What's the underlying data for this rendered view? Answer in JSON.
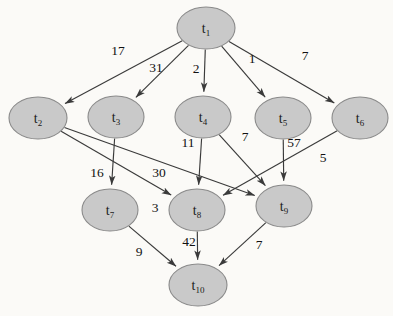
{
  "diagram": {
    "background_color": "#fbfaf7",
    "node_fill": "#c9c9c9",
    "node_stroke": "#8a8a8a",
    "edge_color": "#3a3a3a",
    "nodes": [
      {
        "id": "t1",
        "base": "t",
        "sub": "1",
        "cx": 206,
        "cy": 28,
        "rx": 29,
        "ry": 21
      },
      {
        "id": "t2",
        "base": "t",
        "sub": "2",
        "cx": 38,
        "cy": 118,
        "rx": 29,
        "ry": 21
      },
      {
        "id": "t3",
        "base": "t",
        "sub": "3",
        "cx": 116,
        "cy": 117,
        "rx": 28,
        "ry": 21
      },
      {
        "id": "t4",
        "base": "t",
        "sub": "4",
        "cx": 203,
        "cy": 117,
        "rx": 28,
        "ry": 21
      },
      {
        "id": "t5",
        "base": "t",
        "sub": "5",
        "cx": 283,
        "cy": 118,
        "rx": 28,
        "ry": 21
      },
      {
        "id": "t6",
        "base": "t",
        "sub": "6",
        "cx": 360,
        "cy": 118,
        "rx": 28,
        "ry": 21
      },
      {
        "id": "t7",
        "base": "t",
        "sub": "7",
        "cx": 110,
        "cy": 210,
        "rx": 28,
        "ry": 21
      },
      {
        "id": "t8",
        "base": "t",
        "sub": "8",
        "cx": 197,
        "cy": 210,
        "rx": 28,
        "ry": 21
      },
      {
        "id": "t9",
        "base": "t",
        "sub": "9",
        "cx": 284,
        "cy": 206,
        "rx": 28,
        "ry": 21
      },
      {
        "id": "t10",
        "base": "t",
        "sub": "10",
        "cx": 198,
        "cy": 285,
        "rx": 29,
        "ry": 21
      }
    ],
    "edges": [
      {
        "from": "t1",
        "to": "t2",
        "weight": "17",
        "lx": 118,
        "ly": 52
      },
      {
        "from": "t1",
        "to": "t3",
        "weight": "31",
        "lx": 156,
        "ly": 69
      },
      {
        "from": "t1",
        "to": "t4",
        "weight": "2",
        "lx": 196,
        "ly": 70
      },
      {
        "from": "t1",
        "to": "t5",
        "weight": "1",
        "lx": 252,
        "ly": 60
      },
      {
        "from": "t1",
        "to": "t6",
        "weight": "7",
        "lx": 305,
        "ly": 57
      },
      {
        "from": "t2",
        "to": "t8",
        "weight": "3",
        "lx": 155,
        "ly": 209
      },
      {
        "from": "t2",
        "to": "t9",
        "weight": "30",
        "lx": 159,
        "ly": 174
      },
      {
        "from": "t3",
        "to": "t7",
        "weight": "16",
        "lx": 97,
        "ly": 174
      },
      {
        "from": "t4",
        "to": "t8",
        "weight": "11",
        "lx": 188,
        "ly": 144
      },
      {
        "from": "t4",
        "to": "t9",
        "weight": "7",
        "lx": 245,
        "ly": 138
      },
      {
        "from": "t5",
        "to": "t9",
        "weight": "57",
        "lx": 294,
        "ly": 144
      },
      {
        "from": "t6",
        "to": "t8",
        "weight": "5",
        "lx": 323,
        "ly": 159
      },
      {
        "from": "t7",
        "to": "t10",
        "weight": "9",
        "lx": 139,
        "ly": 253
      },
      {
        "from": "t8",
        "to": "t10",
        "weight": "42",
        "lx": 189,
        "ly": 243
      },
      {
        "from": "t9",
        "to": "t10",
        "weight": "7",
        "lx": 259,
        "ly": 246
      }
    ]
  }
}
